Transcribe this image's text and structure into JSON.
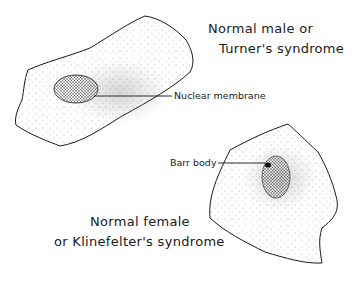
{
  "diagram": {
    "cells": [
      {
        "id": "male-cell",
        "caption_line1": "Normal male or",
        "caption_line2": "Turner's syndrome",
        "structure_label": "Nuclear membrane"
      },
      {
        "id": "female-cell",
        "caption_line1": "Normal female",
        "caption_line2": "or Klinefelter's syndrome",
        "structure_label": "Barr body"
      }
    ],
    "colors": {
      "ink": "#1a1a1a",
      "background": "#ffffff"
    }
  }
}
